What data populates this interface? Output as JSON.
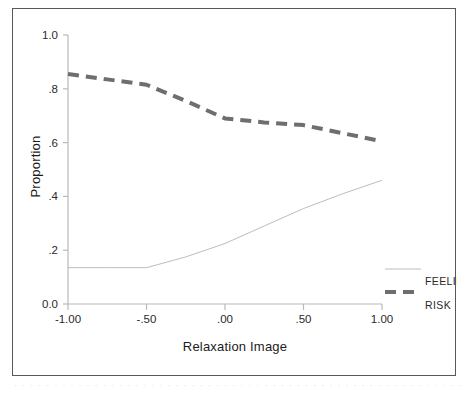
{
  "chart_data": {
    "type": "line",
    "title": "",
    "xlabel": "Relaxation Image",
    "ylabel": "Proportion",
    "xlim": [
      -1.0,
      1.0
    ],
    "ylim": [
      0.0,
      1.0
    ],
    "grid": false,
    "legend_position": "right-bottom",
    "xticks": [
      "-1.00",
      "-.50",
      ".00",
      ".50",
      "1.00"
    ],
    "xtick_values": [
      -1.0,
      -0.5,
      0.0,
      0.5,
      1.0
    ],
    "yticks": [
      "0.0",
      ".2",
      ".4",
      ".6",
      ".8",
      "1.0"
    ],
    "ytick_values": [
      0.0,
      0.2,
      0.4,
      0.6,
      0.8,
      1.0
    ],
    "x": [
      -1.0,
      -0.75,
      -0.5,
      -0.25,
      0.0,
      0.25,
      0.5,
      0.75,
      1.0
    ],
    "series": [
      {
        "name": "FEELING",
        "style": "solid",
        "color": "#b4b4b4",
        "width": 0.9,
        "values": [
          0.135,
          0.135,
          0.135,
          0.175,
          0.225,
          0.29,
          0.355,
          0.41,
          0.46
        ]
      },
      {
        "name": "RISK",
        "style": "dashed",
        "color": "#6e6e72",
        "width": 4.0,
        "values": [
          0.855,
          0.835,
          0.815,
          0.755,
          0.69,
          0.675,
          0.665,
          0.635,
          0.605
        ]
      }
    ]
  },
  "legend": {
    "items": [
      {
        "label": "FEELING",
        "style": "solid",
        "color": "#b4b4b4"
      },
      {
        "label": "RISK",
        "style": "dashed",
        "color": "#6e6e72"
      }
    ]
  },
  "footer": {
    "smudge": "· · · · · · · · · · · · · · · · · · · · · · · · · · · · · · · · · · · · · · · · · · · · · · · · · · · · · · · · · · · ·"
  },
  "colors": {
    "frame": "#58585c",
    "axis": "#b9b9b9",
    "text": "#1b1b1b"
  }
}
